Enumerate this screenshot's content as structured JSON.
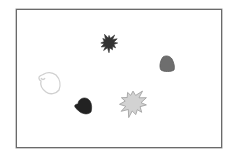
{
  "scene": {
    "background": "#ffffff",
    "frame": {
      "x": 16,
      "y": 9,
      "width": 206,
      "height": 139,
      "border_color": "#6a6a6a"
    },
    "shapes": [
      {
        "id": "dark-star",
        "kind": "star",
        "cx": 109,
        "cy": 43,
        "r_outer": 9,
        "r_inner": 5,
        "points": 12,
        "fill": "#333333",
        "stroke": "#333333"
      },
      {
        "id": "gray-blob",
        "kind": "blob",
        "fill": "#6e6e6e",
        "stroke": "#5a5a5a"
      },
      {
        "id": "outline-blob",
        "kind": "blob-outline",
        "fill": "none",
        "stroke": "#d0d0d0"
      },
      {
        "id": "dark-blob",
        "kind": "blob",
        "fill": "#222222",
        "stroke": "#222222"
      },
      {
        "id": "light-star",
        "kind": "star",
        "cx": 133,
        "cy": 103,
        "r_outer": 14,
        "r_inner": 8,
        "points": 11,
        "fill": "#d2d2d2",
        "stroke": "#9a9a9a"
      }
    ]
  }
}
